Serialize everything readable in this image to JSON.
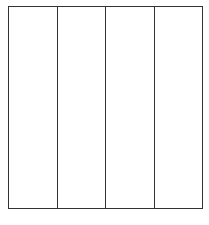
{
  "diagram": {
    "type": "grid",
    "rows": 1,
    "columns": 4,
    "line_color": "#333333",
    "background": "#ffffff",
    "cells": [
      {
        "label": ""
      },
      {
        "label": ""
      },
      {
        "label": ""
      },
      {
        "label": ""
      }
    ]
  }
}
